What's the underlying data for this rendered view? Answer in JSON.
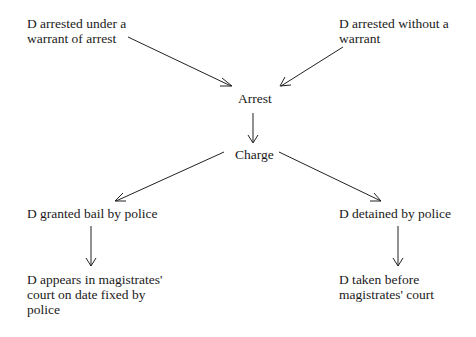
{
  "diagram": {
    "nodes": {
      "warrant": "D arrested under a\nwarrant of arrest",
      "no_warrant": "D arrested without a\nwarrant",
      "arrest": "Arrest",
      "charge": "Charge",
      "bail": "D granted bail by police",
      "detained": "D detained by police",
      "appears": "D appears in magistrates'\ncourt on date fixed by\npolice",
      "taken_before": "D taken before\nmagistrates' court"
    },
    "edges": [
      {
        "from": "warrant",
        "to": "arrest"
      },
      {
        "from": "no_warrant",
        "to": "arrest"
      },
      {
        "from": "arrest",
        "to": "charge"
      },
      {
        "from": "charge",
        "to": "bail"
      },
      {
        "from": "charge",
        "to": "detained"
      },
      {
        "from": "bail",
        "to": "appears"
      },
      {
        "from": "detained",
        "to": "taken_before"
      }
    ]
  }
}
